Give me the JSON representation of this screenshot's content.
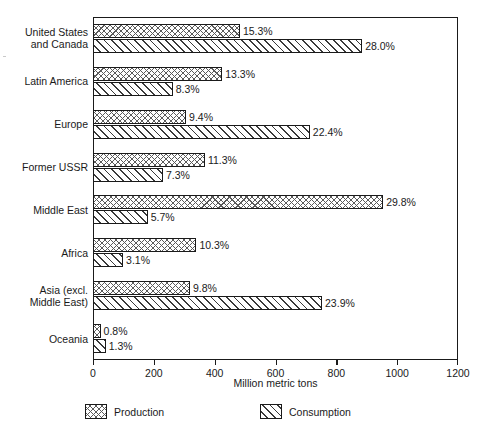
{
  "chart_data": {
    "type": "bar",
    "orientation": "horizontal",
    "title": "",
    "xlabel": "Million metric tons",
    "ylabel": "",
    "xlim": [
      0,
      1200
    ],
    "xticks": [
      0,
      200,
      400,
      600,
      800,
      1000,
      1200
    ],
    "xticklabels": [
      "0",
      "200",
      "400",
      "600",
      "800",
      "1000",
      "1200"
    ],
    "grid": false,
    "legend_position": "below",
    "categories": [
      "United States\nand Canada",
      "Latin America",
      "Europe",
      "Former USSR",
      "Middle East",
      "Africa",
      "Asia (excl.\nMiddle East)",
      "Oceania"
    ],
    "series": [
      {
        "name": "Production",
        "values": [
          483,
          425,
          306,
          368,
          954,
          340,
          319,
          25
        ],
        "labels": [
          "15.3%",
          "13.3%",
          "9.4%",
          "11.3%",
          "29.8%",
          "10.3%",
          "9.8%",
          "0.8%"
        ],
        "pattern": "crosshatch"
      },
      {
        "name": "Consumption",
        "values": [
          885,
          262,
          713,
          230,
          180,
          99,
          753,
          42
        ],
        "labels": [
          "28.0%",
          "8.3%",
          "22.4%",
          "7.3%",
          "5.7%",
          "3.1%",
          "23.9%",
          "1.3%"
        ],
        "pattern": "diagonal-hatch"
      }
    ],
    "colors": {
      "ink": "#1a1a1a",
      "background": "#ffffff",
      "production_hatch": "#5a5a5a",
      "consumption_hatch": "#3a3a3a"
    }
  },
  "legend": {
    "items": [
      {
        "label": "Production"
      },
      {
        "label": "Consumption"
      }
    ]
  },
  "axis": {
    "x_title": "Million metric tons"
  }
}
